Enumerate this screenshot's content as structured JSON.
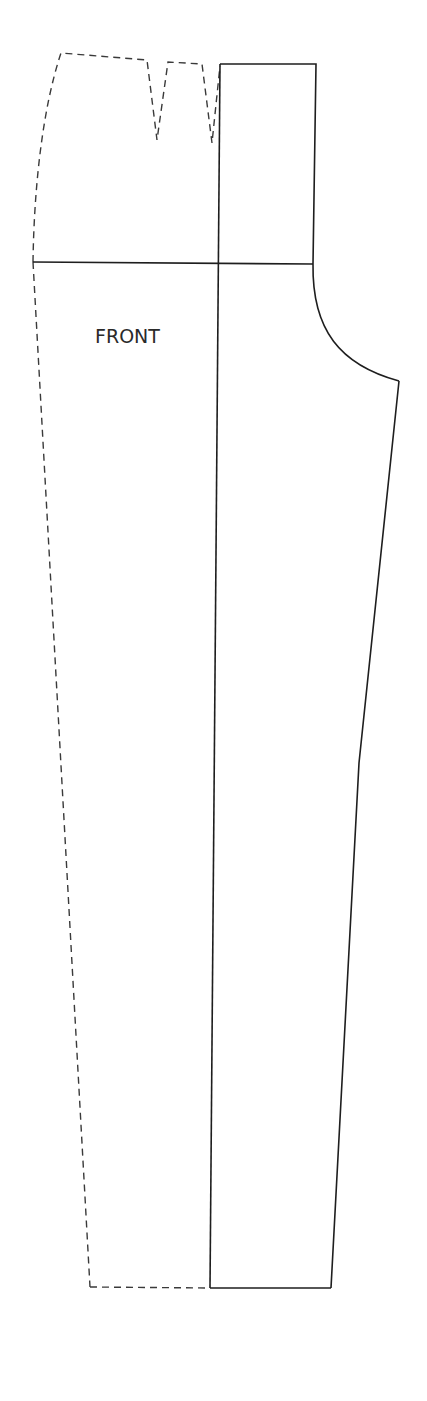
{
  "diagram": {
    "label": "FRONT",
    "label_position": {
      "x": 95,
      "y": 327
    },
    "colors": {
      "background": "#ffffff",
      "line": "#1e1e1e",
      "text": "#2a2a2a"
    },
    "solid_outline": {
      "waistband_rect": {
        "top_left": [
          220,
          64
        ],
        "top_right": [
          316,
          64
        ],
        "bottom_right": [
          313,
          264
        ]
      },
      "hip_line": {
        "from": [
          33,
          262
        ],
        "to": [
          313,
          264
        ]
      },
      "center_line": {
        "from": [
          220,
          64
        ],
        "to": [
          210,
          1288
        ]
      },
      "crotch_curve": {
        "from": [
          313,
          264
        ],
        "control": [
          318,
          355
        ],
        "to": [
          399,
          381
        ]
      },
      "inseam": [
        [
          399,
          381
        ],
        [
          359,
          763
        ],
        [
          331,
          1288
        ]
      ],
      "hem_solid": {
        "from": [
          210,
          1288
        ],
        "to": [
          331,
          1288
        ]
      }
    },
    "dashed_outline": {
      "waist_and_darts": [
        [
          33,
          262
        ],
        [
          61,
          53
        ],
        [
          147,
          60
        ],
        [
          157,
          140
        ],
        [
          168,
          62
        ],
        [
          202,
          64
        ],
        [
          212,
          143
        ],
        [
          220,
          66
        ]
      ],
      "side_seam": {
        "from": [
          33,
          262
        ],
        "to": [
          90,
          1287
        ]
      },
      "hem_dashed": {
        "from": [
          90,
          1287
        ],
        "to": [
          210,
          1288
        ]
      }
    }
  }
}
